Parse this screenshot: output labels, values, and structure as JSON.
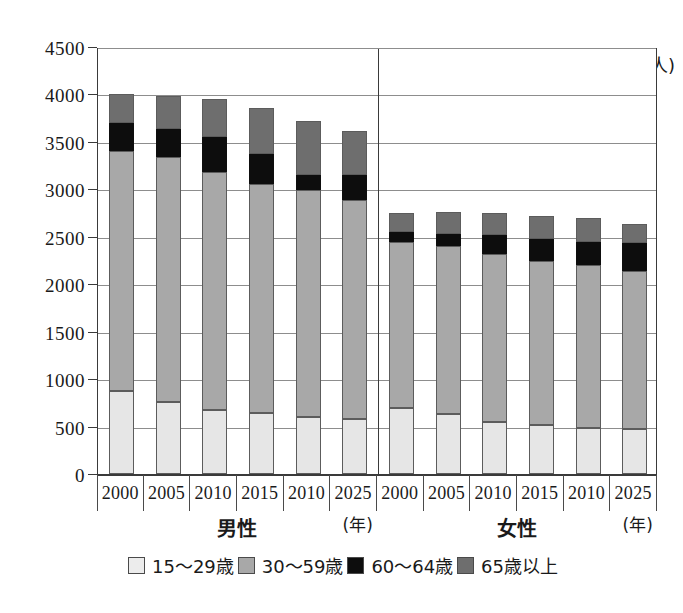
{
  "chart_data": {
    "type": "bar",
    "stacked": true,
    "title": "",
    "subtitle": "",
    "xlabel": "(年)",
    "ylabel": "(万人)",
    "ylim": [
      0,
      4500
    ],
    "ytick_step": 500,
    "yticks": [
      "0",
      "500",
      "1000",
      "1500",
      "2000",
      "2500",
      "3000",
      "3500",
      "4000",
      "4500"
    ],
    "grid": true,
    "legend_position": "bottom",
    "legend": [
      "15〜29歳",
      "30〜59歳",
      "60〜64歳",
      "65歳以上"
    ],
    "colors": {
      "15-29": "#e6e6e6",
      "30-59": "#a8a8a8",
      "60-64": "#0d0d0d",
      "65+": "#6e6e6e"
    },
    "groups": [
      {
        "name": "男性",
        "year_note": "(年)",
        "categories": [
          "2000",
          "2005",
          "2010",
          "2015",
          "2010",
          "2025"
        ],
        "series": [
          {
            "name": "15〜29歳",
            "values": [
              870,
              760,
              670,
              640,
              600,
              580
            ]
          },
          {
            "name": "30〜59歳",
            "values": [
              2530,
              2580,
              2510,
              2420,
              2390,
              2310
            ]
          },
          {
            "name": "60〜64歳",
            "values": [
              300,
              300,
              370,
              310,
              160,
              260
            ]
          },
          {
            "name": "65歳以上",
            "values": [
              300,
              340,
              400,
              490,
              570,
              470
            ]
          }
        ],
        "totals": [
          4000,
          3980,
          3950,
          3860,
          3720,
          3620
        ]
      },
      {
        "name": "女性",
        "year_note": "(年)",
        "categories": [
          "2000",
          "2005",
          "2010",
          "2015",
          "2010",
          "2025"
        ],
        "series": [
          {
            "name": "15〜29歳",
            "values": [
              700,
              630,
              550,
              520,
              490,
              470
            ]
          },
          {
            "name": "30〜59歳",
            "values": [
              1740,
              1770,
              1770,
              1720,
              1710,
              1670
            ]
          },
          {
            "name": "60〜64歳",
            "values": [
              110,
              130,
              200,
              240,
              250,
              290
            ]
          },
          {
            "name": "65歳以上",
            "values": [
              200,
              230,
              230,
              240,
              250,
              210
            ]
          }
        ],
        "totals": [
          2750,
          2760,
          2750,
          2720,
          2700,
          2640
        ]
      }
    ]
  }
}
